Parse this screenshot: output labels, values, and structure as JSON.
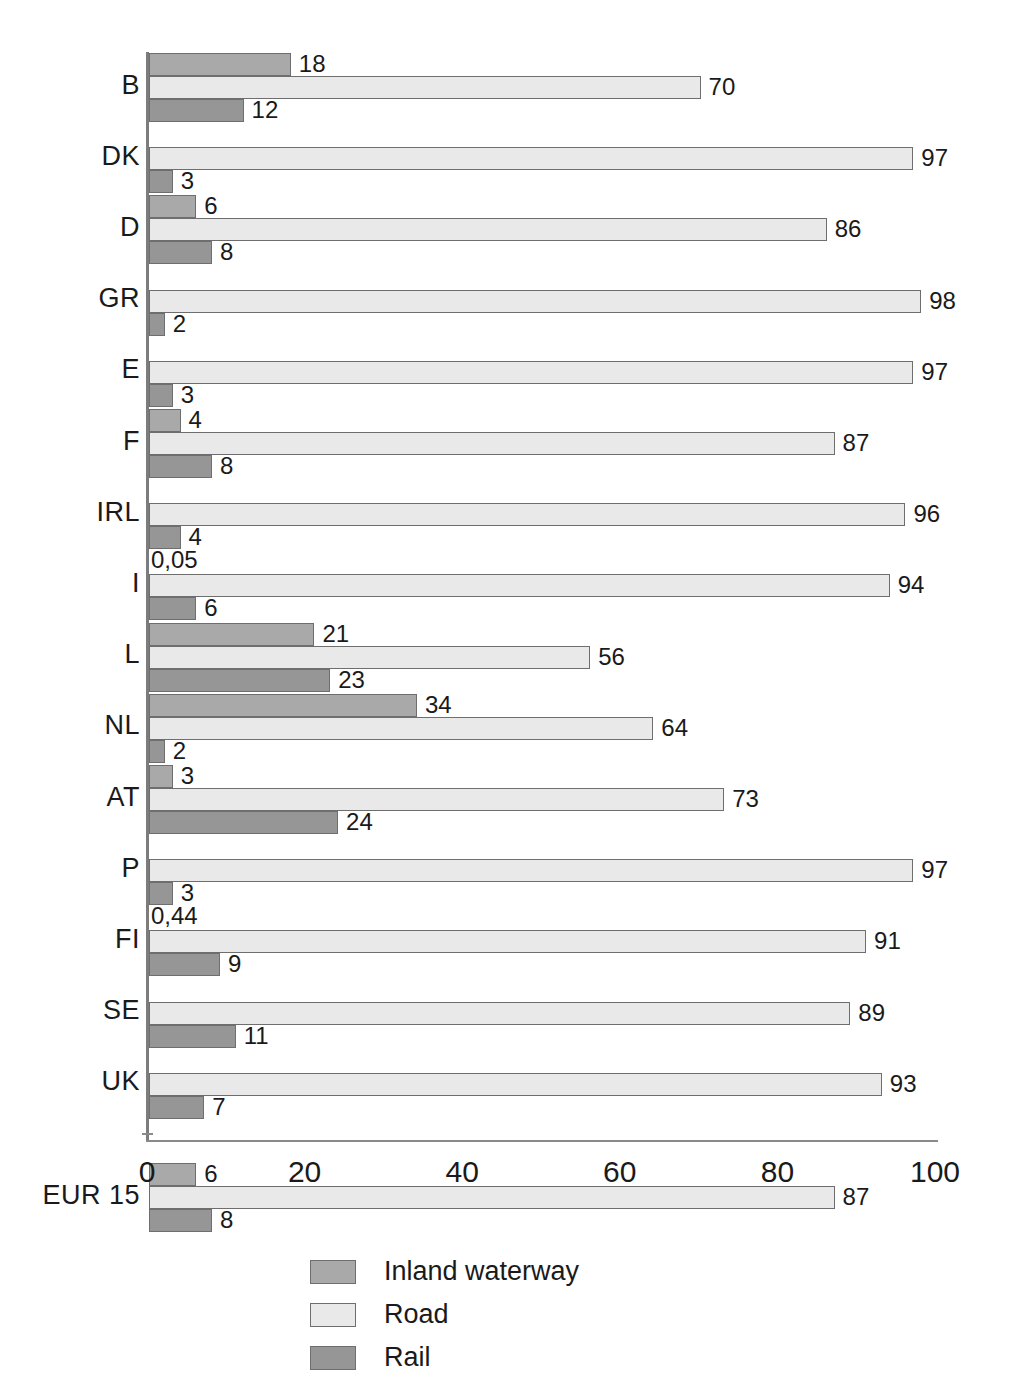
{
  "chart_data": {
    "type": "bar",
    "orientation": "horizontal",
    "title": "",
    "xlabel": "",
    "ylabel": "",
    "xlim": [
      0,
      100
    ],
    "xticks": [
      "0",
      "20",
      "40",
      "60",
      "80",
      "100"
    ],
    "grid": false,
    "legend_position": "bottom",
    "categories": [
      "B",
      "DK",
      "D",
      "GR",
      "E",
      "F",
      "IRL",
      "I",
      "L",
      "NL",
      "AT",
      "P",
      "FI",
      "SE",
      "UK",
      "EUR 15"
    ],
    "series": [
      {
        "name": "Inland waterway",
        "color": "#a9a9a9",
        "values": [
          18,
          null,
          6,
          null,
          null,
          4,
          null,
          0.05,
          21,
          34,
          3,
          null,
          0.44,
          null,
          null,
          6
        ],
        "labels": [
          "18",
          "",
          "6",
          "",
          "",
          "4",
          "",
          "0,05",
          "21",
          "34",
          "3",
          "",
          "0,44",
          "",
          "",
          "6"
        ]
      },
      {
        "name": "Road",
        "color": "#e9e9e9",
        "values": [
          70,
          97,
          86,
          98,
          97,
          87,
          96,
          94,
          56,
          64,
          73,
          97,
          91,
          89,
          93,
          87
        ],
        "labels": [
          "70",
          "97",
          "86",
          "98",
          "97",
          "87",
          "96",
          "94",
          "56",
          "64",
          "73",
          "97",
          "91",
          "89",
          "93",
          "87"
        ]
      },
      {
        "name": "Rail",
        "color": "#969696",
        "values": [
          12,
          3,
          8,
          2,
          3,
          8,
          4,
          6,
          23,
          2,
          24,
          3,
          9,
          11,
          7,
          8
        ],
        "labels": [
          "12",
          "3",
          "8",
          "2",
          "3",
          "8",
          "4",
          "6",
          "23",
          "2",
          "24",
          "3",
          "9",
          "11",
          "7",
          "8"
        ]
      }
    ]
  },
  "legend": {
    "items": [
      {
        "label": "Inland waterway",
        "key": "iw"
      },
      {
        "label": "Road",
        "key": "road"
      },
      {
        "label": "Rail",
        "key": "rail"
      }
    ]
  }
}
